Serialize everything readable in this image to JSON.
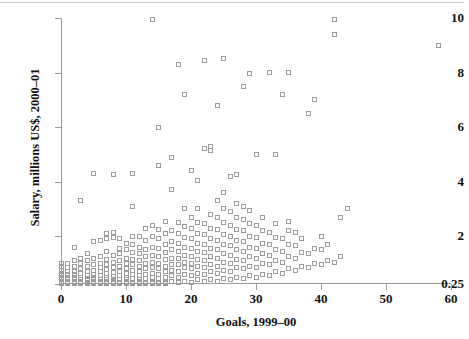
{
  "chart_data": {
    "type": "scatter",
    "title": "",
    "xlabel": "Goals, 1999–00",
    "ylabel": "Salary, millions US$, 2000–01",
    "xlim": [
      0,
      60
    ],
    "ylim": [
      0.25,
      10
    ],
    "xticks": [
      0,
      10,
      20,
      30,
      40,
      50,
      60
    ],
    "xtick_labels": [
      "0",
      "10",
      "20",
      "30",
      "40",
      "50",
      "60"
    ],
    "yticks": [
      0.25,
      2,
      4,
      6,
      8,
      10
    ],
    "ytick_labels": [
      "0.25",
      "2",
      "4",
      "6",
      "8",
      "10"
    ],
    "grid": false,
    "legend": null,
    "marker": "open-square",
    "marker_color": "#9c9c9c",
    "points": [
      [
        0,
        0.3
      ],
      [
        0,
        0.4
      ],
      [
        0,
        0.5
      ],
      [
        0,
        0.6
      ],
      [
        0,
        0.75
      ],
      [
        0,
        0.9
      ],
      [
        0,
        1.0
      ],
      [
        0,
        0.28
      ],
      [
        0,
        0.35
      ],
      [
        0,
        0.45
      ],
      [
        0,
        0.55
      ],
      [
        0,
        0.65
      ],
      [
        1,
        0.3
      ],
      [
        1,
        0.4
      ],
      [
        1,
        0.5
      ],
      [
        1,
        0.6
      ],
      [
        1,
        0.7
      ],
      [
        1,
        0.85
      ],
      [
        1,
        1.0
      ],
      [
        1,
        0.28
      ],
      [
        1,
        0.35
      ],
      [
        1,
        0.45
      ],
      [
        2,
        0.3
      ],
      [
        2,
        0.4
      ],
      [
        2,
        0.5
      ],
      [
        2,
        0.6
      ],
      [
        2,
        0.7
      ],
      [
        2,
        0.9
      ],
      [
        2,
        1.1
      ],
      [
        2,
        1.6
      ],
      [
        2,
        0.28
      ],
      [
        2,
        0.45
      ],
      [
        2,
        0.55
      ],
      [
        3,
        0.3
      ],
      [
        3,
        0.4
      ],
      [
        3,
        0.5
      ],
      [
        3,
        0.65
      ],
      [
        3,
        0.8
      ],
      [
        3,
        1.0
      ],
      [
        3,
        1.2
      ],
      [
        3,
        3.3
      ],
      [
        3,
        0.28
      ],
      [
        3,
        0.35
      ],
      [
        4,
        0.3
      ],
      [
        4,
        0.45
      ],
      [
        4,
        0.55
      ],
      [
        4,
        0.7
      ],
      [
        4,
        0.9
      ],
      [
        4,
        1.1
      ],
      [
        4,
        1.35
      ],
      [
        4,
        0.28
      ],
      [
        4,
        0.38
      ],
      [
        5,
        0.3
      ],
      [
        5,
        0.4
      ],
      [
        5,
        0.5
      ],
      [
        5,
        0.6
      ],
      [
        5,
        0.75
      ],
      [
        5,
        0.95
      ],
      [
        5,
        1.2
      ],
      [
        5,
        1.8
      ],
      [
        5,
        4.3
      ],
      [
        5,
        0.28
      ],
      [
        6,
        0.3
      ],
      [
        6,
        0.42
      ],
      [
        6,
        0.55
      ],
      [
        6,
        0.7
      ],
      [
        6,
        0.85
      ],
      [
        6,
        1.0
      ],
      [
        6,
        1.25
      ],
      [
        6,
        1.85
      ],
      [
        6,
        0.28
      ],
      [
        6,
        0.35
      ],
      [
        7,
        0.3
      ],
      [
        7,
        0.4
      ],
      [
        7,
        0.5
      ],
      [
        7,
        0.62
      ],
      [
        7,
        0.78
      ],
      [
        7,
        0.95
      ],
      [
        7,
        1.15
      ],
      [
        7,
        1.45
      ],
      [
        7,
        1.9
      ],
      [
        7,
        2.1
      ],
      [
        7,
        0.28
      ],
      [
        8,
        0.3
      ],
      [
        8,
        0.4
      ],
      [
        8,
        0.52
      ],
      [
        8,
        0.68
      ],
      [
        8,
        0.85
      ],
      [
        8,
        1.05
      ],
      [
        8,
        1.3
      ],
      [
        8,
        1.95
      ],
      [
        8,
        2.15
      ],
      [
        8,
        4.25
      ],
      [
        8,
        0.28
      ],
      [
        8,
        0.35
      ],
      [
        9,
        0.3
      ],
      [
        9,
        0.42
      ],
      [
        9,
        0.55
      ],
      [
        9,
        0.7
      ],
      [
        9,
        0.9
      ],
      [
        9,
        1.1
      ],
      [
        9,
        1.35
      ],
      [
        9,
        1.55
      ],
      [
        9,
        1.9
      ],
      [
        9,
        0.28
      ],
      [
        10,
        0.3
      ],
      [
        10,
        0.4
      ],
      [
        10,
        0.5
      ],
      [
        10,
        0.65
      ],
      [
        10,
        0.8
      ],
      [
        10,
        1.0
      ],
      [
        10,
        1.2
      ],
      [
        10,
        1.5
      ],
      [
        10,
        1.75
      ],
      [
        10,
        0.28
      ],
      [
        10,
        0.35
      ],
      [
        11,
        0.3
      ],
      [
        11,
        0.45
      ],
      [
        11,
        0.6
      ],
      [
        11,
        0.75
      ],
      [
        11,
        0.95
      ],
      [
        11,
        1.15
      ],
      [
        11,
        1.4
      ],
      [
        11,
        1.7
      ],
      [
        11,
        2.0
      ],
      [
        11,
        3.1
      ],
      [
        11,
        4.3
      ],
      [
        11,
        0.28
      ],
      [
        12,
        0.3
      ],
      [
        12,
        0.42
      ],
      [
        12,
        0.55
      ],
      [
        12,
        0.7
      ],
      [
        12,
        0.9
      ],
      [
        12,
        1.1
      ],
      [
        12,
        1.35
      ],
      [
        12,
        1.6
      ],
      [
        12,
        2.0
      ],
      [
        12,
        0.28
      ],
      [
        12,
        0.35
      ],
      [
        13,
        0.3
      ],
      [
        13,
        0.45
      ],
      [
        13,
        0.6
      ],
      [
        13,
        0.8
      ],
      [
        13,
        1.0
      ],
      [
        13,
        1.25
      ],
      [
        13,
        1.5
      ],
      [
        13,
        1.85
      ],
      [
        13,
        2.3
      ],
      [
        13,
        0.28
      ],
      [
        14,
        0.3
      ],
      [
        14,
        0.5
      ],
      [
        14,
        0.65
      ],
      [
        14,
        0.85
      ],
      [
        14,
        1.05
      ],
      [
        14,
        1.3
      ],
      [
        14,
        1.6
      ],
      [
        14,
        2.0
      ],
      [
        14,
        2.4
      ],
      [
        14,
        9.95
      ],
      [
        14,
        0.28
      ],
      [
        15,
        0.3
      ],
      [
        15,
        0.45
      ],
      [
        15,
        0.6
      ],
      [
        15,
        0.8
      ],
      [
        15,
        1.0
      ],
      [
        15,
        1.25
      ],
      [
        15,
        1.55
      ],
      [
        15,
        1.9
      ],
      [
        15,
        2.25
      ],
      [
        15,
        4.6
      ],
      [
        15,
        6.0
      ],
      [
        15,
        0.28
      ],
      [
        16,
        0.3
      ],
      [
        16,
        0.5
      ],
      [
        16,
        0.7
      ],
      [
        16,
        0.9
      ],
      [
        16,
        1.15
      ],
      [
        16,
        1.4
      ],
      [
        16,
        1.7
      ],
      [
        16,
        2.1
      ],
      [
        16,
        2.55
      ],
      [
        16,
        0.28
      ],
      [
        16,
        0.35
      ],
      [
        17,
        0.35
      ],
      [
        17,
        0.55
      ],
      [
        17,
        0.75
      ],
      [
        17,
        0.95
      ],
      [
        17,
        1.2
      ],
      [
        17,
        1.5
      ],
      [
        17,
        1.8
      ],
      [
        17,
        2.2
      ],
      [
        17,
        3.7
      ],
      [
        17,
        4.9
      ],
      [
        18,
        0.3
      ],
      [
        18,
        0.5
      ],
      [
        18,
        0.7
      ],
      [
        18,
        0.95
      ],
      [
        18,
        1.2
      ],
      [
        18,
        1.45
      ],
      [
        18,
        1.75
      ],
      [
        18,
        2.1
      ],
      [
        18,
        2.5
      ],
      [
        18,
        8.3
      ],
      [
        19,
        0.35
      ],
      [
        19,
        0.6
      ],
      [
        19,
        0.85
      ],
      [
        19,
        1.05
      ],
      [
        19,
        1.3
      ],
      [
        19,
        1.6
      ],
      [
        19,
        1.95
      ],
      [
        19,
        2.35
      ],
      [
        19,
        3.0
      ],
      [
        19,
        7.2
      ],
      [
        20,
        0.3
      ],
      [
        20,
        0.55
      ],
      [
        20,
        0.8
      ],
      [
        20,
        1.0
      ],
      [
        20,
        1.25
      ],
      [
        20,
        1.55
      ],
      [
        20,
        1.9
      ],
      [
        20,
        2.3
      ],
      [
        20,
        2.7
      ],
      [
        20,
        4.4
      ],
      [
        21,
        0.4
      ],
      [
        21,
        0.65
      ],
      [
        21,
        0.9
      ],
      [
        21,
        1.15
      ],
      [
        21,
        1.45
      ],
      [
        21,
        1.75
      ],
      [
        21,
        2.1
      ],
      [
        21,
        2.5
      ],
      [
        21,
        3.0
      ],
      [
        21,
        4.05
      ],
      [
        22,
        0.35
      ],
      [
        22,
        0.6
      ],
      [
        22,
        0.85
      ],
      [
        22,
        1.1
      ],
      [
        22,
        1.4
      ],
      [
        22,
        1.7
      ],
      [
        22,
        2.05
      ],
      [
        22,
        2.45
      ],
      [
        22,
        5.2
      ],
      [
        22,
        8.45
      ],
      [
        23,
        0.4
      ],
      [
        23,
        0.7
      ],
      [
        23,
        0.95
      ],
      [
        23,
        1.25
      ],
      [
        23,
        1.55
      ],
      [
        23,
        1.9
      ],
      [
        23,
        2.3
      ],
      [
        23,
        2.8
      ],
      [
        23,
        5.15
      ],
      [
        23,
        5.3
      ],
      [
        24,
        0.35
      ],
      [
        24,
        0.65
      ],
      [
        24,
        0.9
      ],
      [
        24,
        1.2
      ],
      [
        24,
        1.5
      ],
      [
        24,
        1.85
      ],
      [
        24,
        2.25
      ],
      [
        24,
        2.7
      ],
      [
        24,
        3.3
      ],
      [
        24,
        6.8
      ],
      [
        25,
        0.45
      ],
      [
        25,
        0.75
      ],
      [
        25,
        1.05
      ],
      [
        25,
        1.35
      ],
      [
        25,
        1.7
      ],
      [
        25,
        2.05
      ],
      [
        25,
        2.5
      ],
      [
        25,
        3.0
      ],
      [
        25,
        3.6
      ],
      [
        25,
        8.5
      ],
      [
        26,
        0.4
      ],
      [
        26,
        0.7
      ],
      [
        26,
        1.0
      ],
      [
        26,
        1.3
      ],
      [
        26,
        1.65
      ],
      [
        26,
        2.0
      ],
      [
        26,
        2.4
      ],
      [
        26,
        2.9
      ],
      [
        26,
        4.2
      ],
      [
        27,
        0.5
      ],
      [
        27,
        0.85
      ],
      [
        27,
        1.15
      ],
      [
        27,
        1.5
      ],
      [
        27,
        1.85
      ],
      [
        27,
        2.25
      ],
      [
        27,
        2.7
      ],
      [
        27,
        3.2
      ],
      [
        27,
        4.25
      ],
      [
        28,
        0.45
      ],
      [
        28,
        0.8
      ],
      [
        28,
        1.1
      ],
      [
        28,
        1.45
      ],
      [
        28,
        1.8
      ],
      [
        28,
        2.2
      ],
      [
        28,
        2.6
      ],
      [
        28,
        3.1
      ],
      [
        28,
        7.5
      ],
      [
        29,
        0.55
      ],
      [
        29,
        0.9
      ],
      [
        29,
        1.25
      ],
      [
        29,
        1.6
      ],
      [
        29,
        2.0
      ],
      [
        29,
        2.45
      ],
      [
        29,
        2.95
      ],
      [
        29,
        7.95
      ],
      [
        30,
        0.5
      ],
      [
        30,
        0.85
      ],
      [
        30,
        1.2
      ],
      [
        30,
        1.55
      ],
      [
        30,
        1.95
      ],
      [
        30,
        2.4
      ],
      [
        30,
        5.0
      ],
      [
        31,
        0.6
      ],
      [
        31,
        1.0
      ],
      [
        31,
        1.35
      ],
      [
        31,
        1.75
      ],
      [
        31,
        2.2
      ],
      [
        31,
        2.7
      ],
      [
        32,
        0.55
      ],
      [
        32,
        0.95
      ],
      [
        32,
        1.3
      ],
      [
        32,
        1.7
      ],
      [
        32,
        2.15
      ],
      [
        32,
        8.0
      ],
      [
        33,
        0.7
      ],
      [
        33,
        1.1
      ],
      [
        33,
        1.5
      ],
      [
        33,
        1.95
      ],
      [
        33,
        2.45
      ],
      [
        33,
        5.0
      ],
      [
        34,
        0.65
      ],
      [
        34,
        1.05
      ],
      [
        34,
        1.45
      ],
      [
        34,
        1.9
      ],
      [
        34,
        7.2
      ],
      [
        35,
        0.8
      ],
      [
        35,
        1.25
      ],
      [
        35,
        1.7
      ],
      [
        35,
        2.2
      ],
      [
        35,
        2.55
      ],
      [
        35,
        8.0
      ],
      [
        36,
        0.75
      ],
      [
        36,
        1.2
      ],
      [
        36,
        1.65
      ],
      [
        36,
        2.15
      ],
      [
        37,
        0.9
      ],
      [
        37,
        1.4
      ],
      [
        37,
        1.9
      ],
      [
        38,
        0.85
      ],
      [
        38,
        1.35
      ],
      [
        38,
        6.5
      ],
      [
        39,
        1.0
      ],
      [
        39,
        1.55
      ],
      [
        39,
        7.0
      ],
      [
        40,
        0.95
      ],
      [
        40,
        1.5
      ],
      [
        40,
        2.0
      ],
      [
        41,
        1.1
      ],
      [
        41,
        1.7
      ],
      [
        42,
        1.05
      ],
      [
        42,
        9.95
      ],
      [
        42,
        9.4
      ],
      [
        43,
        1.25
      ],
      [
        43,
        2.7
      ],
      [
        44,
        3.0
      ],
      [
        58,
        9.0
      ]
    ]
  },
  "axis": {
    "x_title": "Goals, 1999–00",
    "y_title": "Salary, millions US$, 2000–01"
  }
}
